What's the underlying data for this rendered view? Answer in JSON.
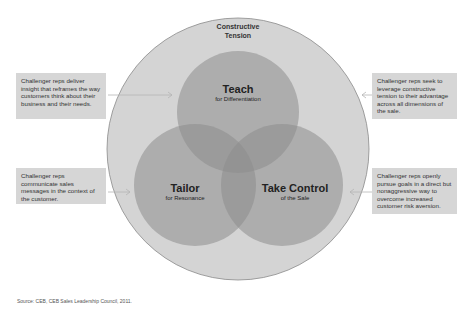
{
  "diagram": {
    "outer_label_line1": "Constructive",
    "outer_label_line2": "Tension",
    "circles": [
      {
        "title": "Teach",
        "subtitle": "for Differentiation"
      },
      {
        "title": "Tailor",
        "subtitle": "for Resonance"
      },
      {
        "title": "Take Control",
        "subtitle": "of the Sale"
      }
    ],
    "callouts": {
      "top_left": "Challenger reps deliver insight that reframes the way customers think about their business and their needs.",
      "bottom_left": "Challenger reps communicate sales messages in the context of the customer.",
      "top_right": "Challenger reps seek to leverage constructive tension to their advantage across all dimensions of the sale.",
      "bottom_right": "Challenger reps openly pursue goals in a direct but nonaggressive way to overcome increased customer risk aversion."
    },
    "colors": {
      "outer_circle": "#d4d4d4",
      "inner_circle": "#9e9e9e",
      "callout_bg": "#d6d6d6"
    }
  },
  "source": "Source: CEB, CEB Sales Leadership Council, 2011."
}
